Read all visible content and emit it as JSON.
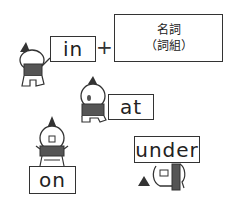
{
  "diagram": {
    "formula": {
      "preposition": "in",
      "operator": "+",
      "noun_line1": "名詞",
      "noun_line2": "（詞組）"
    },
    "prepositions": [
      {
        "label": "at"
      },
      {
        "label": "on"
      },
      {
        "label": "under"
      }
    ]
  },
  "colors": {
    "line": "#333333",
    "shirt": "#555555",
    "background": "#ffffff"
  }
}
